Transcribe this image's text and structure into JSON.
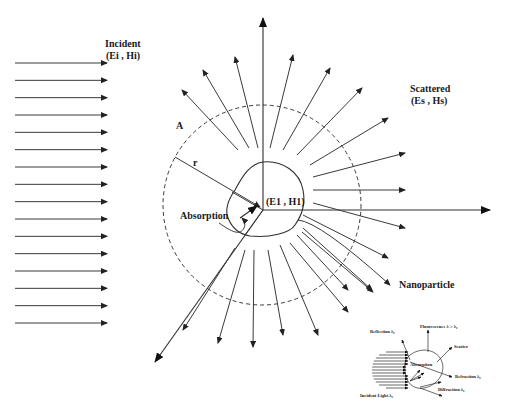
{
  "diagram": {
    "labels": {
      "incident_title": "Incident",
      "incident_fields": "(Ei , Hi)",
      "scattered_title": "Scattered",
      "scattered_fields": "(Es , Hs)",
      "internal_fields": "(E1 , H1)",
      "area": "A",
      "radius": "r",
      "absorption": "Absorption",
      "nanoparticle": "Nanoparticle"
    },
    "incident_arrows": {
      "count": 16,
      "x_start": 15,
      "x_end": 107,
      "y_first": 63,
      "y_last": 323
    },
    "center": {
      "x": 263,
      "y": 210
    },
    "dashed_circle": {
      "cx": 262,
      "cy": 205,
      "rx": 99,
      "ry": 100
    },
    "inset": {
      "labels": {
        "reflection": "Reflection λ₀",
        "fluorescence": "Fluorescence λ > λ₀",
        "scatter": "Scatter",
        "absorption": "Absorption",
        "refraction": "Refraction λ₀",
        "diffraction": "Diffraction λ₀",
        "incident_light": "Incident Light λ₀"
      }
    },
    "colors": {
      "background": "#ffffff",
      "line": "#3a3a3a",
      "text": "#1a1a1a"
    }
  }
}
